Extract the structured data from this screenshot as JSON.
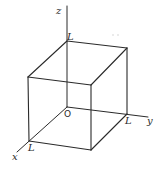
{
  "diagram": {
    "type": "3d-cube-on-axes",
    "axes": {
      "x": {
        "label": "x",
        "from": [
          67,
          107
        ],
        "to": [
          17,
          152
        ],
        "label_pos": [
          13,
          159
        ]
      },
      "y": {
        "label": "y",
        "from": [
          67,
          107
        ],
        "to": [
          148,
          117
        ],
        "label_pos": [
          147,
          124
        ]
      },
      "z": {
        "label": "z",
        "from": [
          67,
          107
        ],
        "to": [
          67,
          6
        ],
        "label_pos": [
          56,
          14
        ]
      }
    },
    "origin": {
      "label": "O",
      "pos": [
        64,
        117
      ]
    },
    "vertices": {
      "origin": [
        67,
        107
      ],
      "top_back_left": [
        67,
        41
      ],
      "top_back_right": [
        127,
        48
      ],
      "top_front_left": [
        28,
        77
      ],
      "top_front_right": [
        91,
        85
      ],
      "bottom_back_right": [
        127,
        114
      ],
      "bottom_front_left": [
        29,
        141
      ],
      "bottom_front_right": [
        91,
        150
      ]
    },
    "edges": [
      [
        "top_back_left",
        "top_back_right"
      ],
      [
        "top_back_left",
        "top_front_left"
      ],
      [
        "top_back_right",
        "top_front_right"
      ],
      [
        "top_front_left",
        "top_front_right"
      ],
      [
        "top_front_left",
        "bottom_front_left"
      ],
      [
        "top_front_right",
        "bottom_front_right"
      ],
      [
        "top_back_right",
        "bottom_back_right"
      ],
      [
        "bottom_front_left",
        "bottom_front_right"
      ],
      [
        "bottom_back_right",
        "bottom_front_right"
      ]
    ],
    "side_labels": [
      {
        "text": "L",
        "pos": [
          67,
          40
        ],
        "axis": "z"
      },
      {
        "text": "L",
        "pos": [
          126,
          124
        ],
        "axis": "y"
      },
      {
        "text": "L",
        "pos": [
          29,
          150
        ],
        "axis": "x"
      }
    ],
    "stroke_color": "#2a2a2a",
    "background": "#ffffff"
  }
}
